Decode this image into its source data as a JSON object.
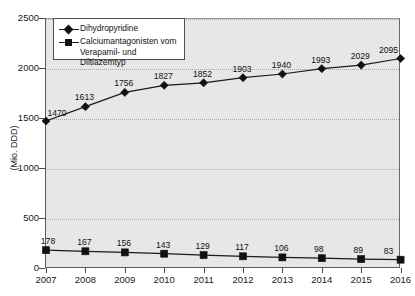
{
  "chart_data": {
    "type": "line",
    "title": "",
    "xlabel": "",
    "ylabel": "(Mio. DDD)",
    "ylim": [
      0,
      2500
    ],
    "yticks": [
      0,
      500,
      1000,
      1500,
      2000,
      2500
    ],
    "ytick_labels": [
      "0",
      "500",
      "1000",
      "1500",
      "2000",
      "2500"
    ],
    "grid": true,
    "grid_axis": "y",
    "legend_position": "upper-left-inside",
    "categories": [
      "2007",
      "2008",
      "2009",
      "2010",
      "2011",
      "2012",
      "2013",
      "2014",
      "2015",
      "2016"
    ],
    "series": [
      {
        "name": "Dihydropyridine",
        "marker": "diamond",
        "color": "#111111",
        "values": [
          1470,
          1613,
          1756,
          1827,
          1852,
          1903,
          1940,
          1993,
          2029,
          2095
        ],
        "labels": [
          "1470",
          "1613",
          "1756",
          "1827",
          "1852",
          "1903",
          "1940",
          "1993",
          "2029",
          "2095"
        ]
      },
      {
        "name": "Calciumantagonisten vom Verapamil- und Diltiazemtyp",
        "name_line1": "Calciumantagonisten vom",
        "name_line2": "Verapamil- und Diltiazemtyp",
        "marker": "square",
        "color": "#111111",
        "values": [
          178,
          167,
          156,
          143,
          129,
          117,
          106,
          98,
          89,
          83
        ],
        "labels": [
          "178",
          "167",
          "156",
          "143",
          "129",
          "117",
          "106",
          "98",
          "89",
          "83"
        ]
      }
    ]
  },
  "colors": {
    "plot_background": "#e7e7e7",
    "page_background": "#ffffff",
    "axis": "#4a4a4a",
    "gridline": "#a8a8a8",
    "series": "#111111"
  }
}
